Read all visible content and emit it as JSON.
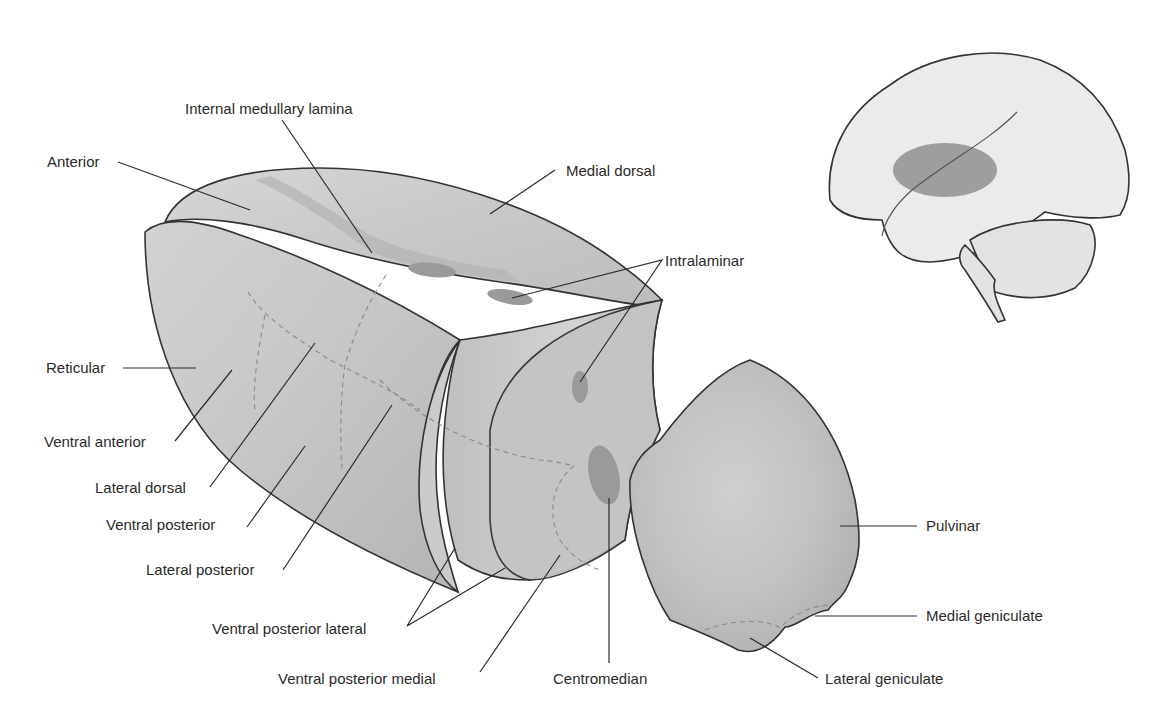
{
  "figure": {
    "colors": {
      "tissue_light": "#d9d9d9",
      "tissue_mid": "#c4c4c4",
      "tissue_dark": "#a8a8a8",
      "nucleus_spot": "#9a9a9a",
      "brain_fill": "#ebebeb",
      "brain_highlight": "#9e9e9e",
      "line": "#2a2a2a"
    }
  },
  "labels": {
    "internal_medullary_lamina": "Internal medullary lamina",
    "anterior": "Anterior",
    "medial_dorsal": "Medial dorsal",
    "intralaminar": "Intralaminar",
    "reticular": "Reticular",
    "ventral_anterior": "Ventral anterior",
    "lateral_dorsal": "Lateral dorsal",
    "ventral_posterior": "Ventral posterior",
    "lateral_posterior": "Lateral posterior",
    "ventral_posterior_lateral": "Ventral posterior lateral",
    "ventral_posterior_medial": "Ventral posterior medial",
    "centromedian": "Centromedian",
    "pulvinar": "Pulvinar",
    "medial_geniculate": "Medial geniculate",
    "lateral_geniculate": "Lateral geniculate"
  },
  "inset": {
    "name": "Brain lateral view with thalamus location highlighted"
  }
}
